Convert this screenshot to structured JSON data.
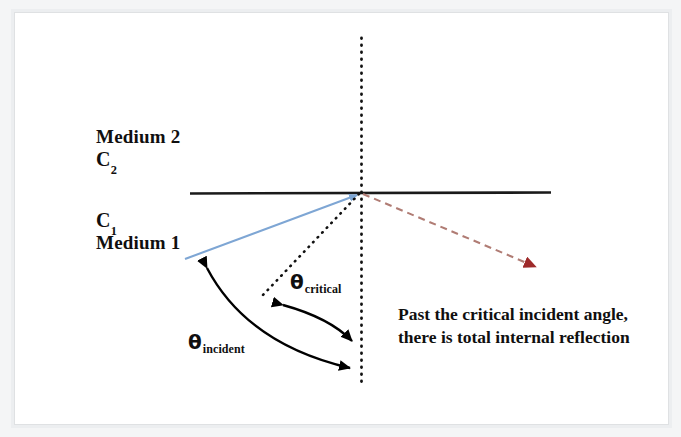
{
  "figure": {
    "labels": {
      "medium_upper": "Medium 2",
      "speed_upper_base": "C",
      "speed_upper_sub": "2",
      "speed_lower_base": "C",
      "speed_lower_sub": "1",
      "medium_lower": "Medium 1"
    },
    "angles": {
      "critical_symbol": "θ",
      "critical_sub": "critical",
      "incident_symbol": "θ",
      "incident_sub": "incident"
    },
    "note": "Past the critical incident angle, there is total internal reflection",
    "colors": {
      "incident_ray": "#7EA6D4",
      "reflected_ray": "#B07C74",
      "reflected_arrowhead": "#9E2A2A",
      "interface_line": "#1A1A1A",
      "normal_line": "#111111",
      "arc_arrow": "#000000",
      "text": "#100F0F",
      "paper": "#FFFFFF",
      "frame": "#DFE1E3"
    },
    "geometry": {
      "interface_y": 193,
      "interface_x_start": 190,
      "interface_x_end": 551,
      "normal_x": 361,
      "normal_y_start": 38,
      "normal_y_end": 383,
      "origin_x": 361,
      "origin_y": 193,
      "incident_ray_start_x": 185,
      "incident_ray_start_y": 259,
      "critical_ray_end_x": 262,
      "critical_ray_end_y": 296,
      "reflected_ray_end_x": 538,
      "reflected_ray_end_y": 268
    }
  }
}
